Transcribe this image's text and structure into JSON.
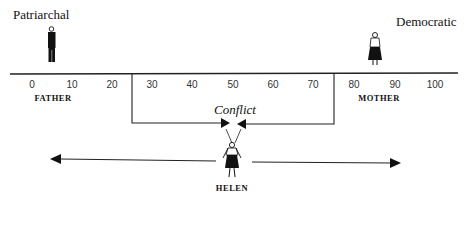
{
  "diagram": {
    "left_pole": "Patriarchal",
    "right_pole": "Democratic",
    "scale": {
      "ticks": [
        "0",
        "10",
        "20",
        "30",
        "40",
        "50",
        "60",
        "70",
        "80",
        "90",
        "100"
      ],
      "min": 0,
      "max": 100
    },
    "figures": {
      "father": {
        "label": "FATHER",
        "position": 5
      },
      "mother": {
        "label": "MOTHER",
        "position": 85
      },
      "child": {
        "label": "HELEN"
      }
    },
    "conflict_label": "Conflict",
    "colors": {
      "ink": "#111111",
      "background": "#ffffff"
    }
  }
}
